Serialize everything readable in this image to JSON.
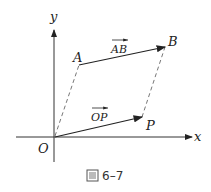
{
  "figure": {
    "caption": "图 6–7",
    "caption_icon": "figure-glyph-icon",
    "axes": {
      "x_label": "x",
      "y_label": "y",
      "origin_label": "O"
    },
    "points": {
      "A": "A",
      "B": "B",
      "P": "P"
    },
    "vectors": {
      "AB": "AB",
      "OP": "OP"
    },
    "colors": {
      "stroke": "#222222",
      "dashed": "#777777"
    }
  }
}
